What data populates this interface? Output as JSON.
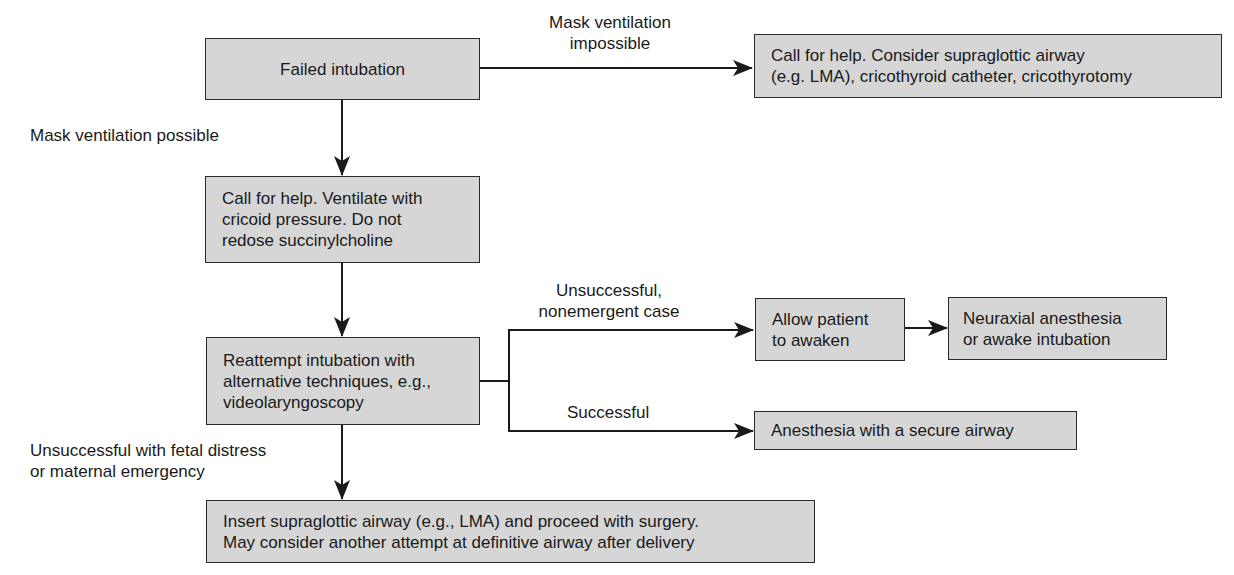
{
  "flowchart": {
    "nodes": {
      "failed_intubation": {
        "lines": [
          "Failed intubation"
        ]
      },
      "call_help_airway": {
        "lines": [
          "Call for help. Consider supraglottic airway",
          "(e.g. LMA), cricothyroid catheter, cricothyrotomy"
        ]
      },
      "call_help_ventilate": {
        "lines": [
          "Call for help. Ventilate with",
          "cricoid pressure. Do not",
          "redose succinylcholine"
        ]
      },
      "reattempt": {
        "lines": [
          "Reattempt intubation with",
          "alternative techniques, e.g.,",
          "videolaryngoscopy"
        ]
      },
      "allow_awaken": {
        "lines": [
          "Allow patient",
          "to awaken"
        ]
      },
      "neuraxial": {
        "lines": [
          "Neuraxial anesthesia",
          "or awake intubation"
        ]
      },
      "secure_airway": {
        "lines": [
          "Anesthesia with a secure airway"
        ]
      },
      "insert_sga": {
        "lines": [
          "Insert supraglottic airway (e.g., LMA) and proceed with surgery.",
          "May consider another attempt at definitive airway after delivery"
        ]
      }
    },
    "edge_labels": {
      "mask_impossible": [
        "Mask ventilation",
        "impossible"
      ],
      "mask_possible": [
        "Mask ventilation possible"
      ],
      "unsuccessful_nonemergent": [
        "Unsuccessful,",
        "nonemergent case"
      ],
      "successful": [
        "Successful"
      ],
      "unsuccessful_fetal": [
        "Unsuccessful with fetal distress",
        "or maternal emergency"
      ]
    },
    "colors": {
      "box_fill": "#d6d6d6",
      "stroke": "#1a1a1a"
    }
  }
}
